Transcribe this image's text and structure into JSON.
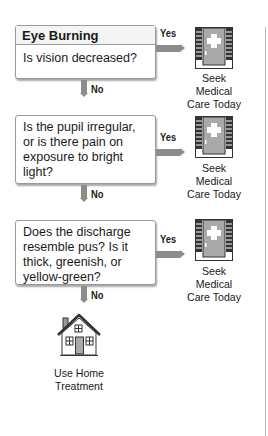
{
  "title": "Eye Burning",
  "steps": [
    {
      "question": "Is vision decreased?",
      "yes_label": "Yes",
      "no_label": "No",
      "yes_outcome": "Seek Medical Care Today",
      "yes_outcome_lines": [
        "Seek Medical",
        "Care Today"
      ]
    },
    {
      "question": "Is the pupil irregular, or is there pain on exposure to bright light?",
      "yes_label": "Yes",
      "no_label": "No",
      "yes_outcome": "Seek Medical Care Today",
      "yes_outcome_lines": [
        "Seek Medical",
        "Care Today"
      ]
    },
    {
      "question": "Does the discharge resemble pus? Is it thick, greenish, or yellow-green?",
      "yes_label": "Yes",
      "no_label": "No",
      "yes_outcome": "Seek Medical Care Today",
      "yes_outcome_lines": [
        "Seek Medical",
        "Care Today"
      ]
    }
  ],
  "final_outcome": {
    "label_lines": [
      "Use Home",
      "Treatment"
    ],
    "icon": "house-icon"
  },
  "icons": {
    "medical": "medical-door-icon",
    "home": "house-icon"
  },
  "colors": {
    "connector": "#8c8c8c",
    "box_border": "#9a9a9a",
    "door_fill": "#a9a9a9",
    "brick": "#333333"
  }
}
